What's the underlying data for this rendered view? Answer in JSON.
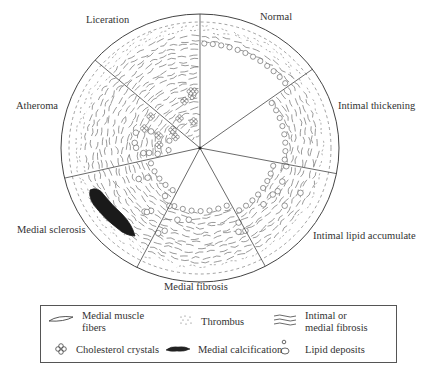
{
  "diagram": {
    "type": "artery-cross-section",
    "center": [
      200,
      148
    ],
    "radius_x": 139,
    "radius_y": 134,
    "colors": {
      "line": "#444444",
      "fill": "#ffffff",
      "calcification": "#1a1a1a"
    },
    "segments": [
      {
        "name": "Normal",
        "label": "Normal",
        "from_deg": -90,
        "to_deg": -36,
        "lumen_r": 105
      },
      {
        "name": "Intimal thickening",
        "label": "Intimal thickening",
        "from_deg": -36,
        "to_deg": 11,
        "lumen_r": 82
      },
      {
        "name": "Intimal lipid accumulate",
        "label": "Intimal lipid accumulate",
        "from_deg": 11,
        "to_deg": 62,
        "lumen_r": 72
      },
      {
        "name": "Medial fibrosis",
        "label": "Medial fibrosis",
        "from_deg": 62,
        "to_deg": 117,
        "lumen_r": 62
      },
      {
        "name": "Medial sclerosis",
        "label": "Medial sclerosis",
        "from_deg": 117,
        "to_deg": 167,
        "lumen_r": 48
      },
      {
        "name": "Atheroma",
        "label": "Atheroma",
        "from_deg": 167,
        "to_deg": 221,
        "lumen_r": 28
      },
      {
        "name": "Liceration",
        "label": "Liceration",
        "from_deg": 221,
        "to_deg": 270,
        "lumen_r": 0
      }
    ]
  },
  "labels": {
    "normal": "Normal",
    "intimal_thickening": "Intimal thickening",
    "intimal_lipid": "Intimal lipid accumulate",
    "medial_fibrosis": "Medial fibrosis",
    "medial_sclerosis": "Medial sclerosis",
    "atheroma": "Atheroma",
    "liceration": "Liceration"
  },
  "legend": {
    "items": [
      {
        "icon": "medial-muscle-fiber-icon",
        "label_line1": "Medial muscle",
        "label_line2": "fibers"
      },
      {
        "icon": "thrombus-icon",
        "label": "Thrombus"
      },
      {
        "icon": "fibrosis-icon",
        "label_line1": "Intimal or",
        "label_line2": "medial fibrosis"
      },
      {
        "icon": "cholesterol-crystal-icon",
        "label": "Cholesterol crystals"
      },
      {
        "icon": "calcification-icon",
        "label": "Medial calcification"
      },
      {
        "icon": "lipid-deposit-icon",
        "label": "Lipid deposits"
      }
    ]
  }
}
